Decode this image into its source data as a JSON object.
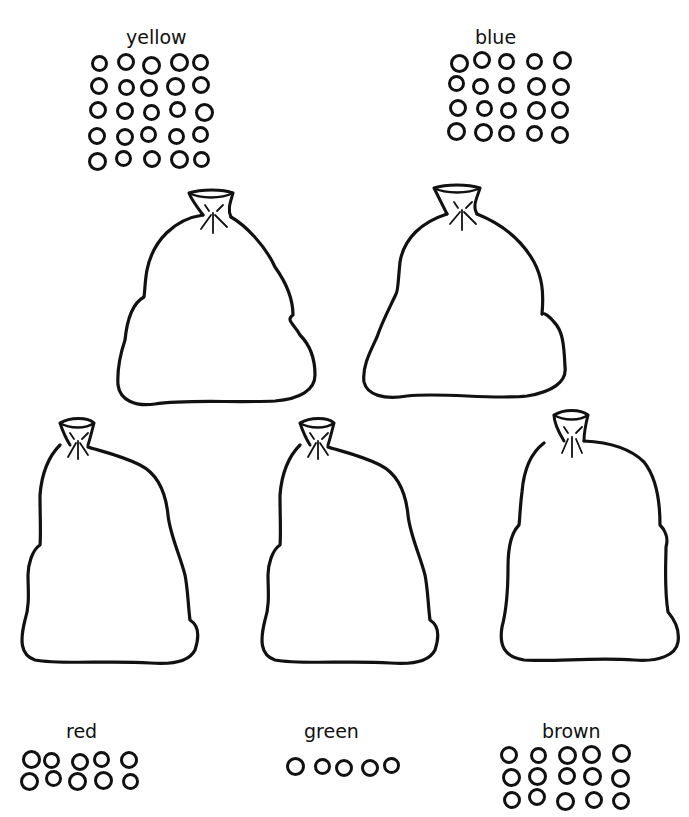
{
  "worksheet": {
    "groups": [
      {
        "id": "yellow",
        "label": "yellow",
        "count": 25,
        "rows": 5,
        "cols": 5
      },
      {
        "id": "blue",
        "label": "blue",
        "count": 20,
        "rows": 4,
        "cols": 5
      },
      {
        "id": "red",
        "label": "red",
        "count": 10,
        "rows": 2,
        "cols": 5
      },
      {
        "id": "green",
        "label": "green",
        "count": 5,
        "rows": 1,
        "cols": 5
      },
      {
        "id": "brown",
        "label": "brown",
        "count": 15,
        "rows": 3,
        "cols": 5
      }
    ],
    "sacks": [
      {
        "id": "sack-1"
      },
      {
        "id": "sack-2"
      },
      {
        "id": "sack-3"
      },
      {
        "id": "sack-4"
      },
      {
        "id": "sack-5"
      }
    ]
  }
}
